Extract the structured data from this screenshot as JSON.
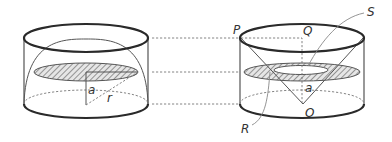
{
  "figure": {
    "colors": {
      "line": "#2a2a2a",
      "dash": "#777777",
      "hatch": "#666666",
      "background": "#ffffff"
    },
    "left_solid": {
      "name": "hemisphere-in-cylinder",
      "labels": {
        "height": "a",
        "radius": "r"
      }
    },
    "right_solid": {
      "name": "cylinder-minus-cone",
      "labels": {
        "P": "P",
        "Q": "Q",
        "S": "S",
        "R": "R",
        "O": "O",
        "height": "a"
      }
    },
    "guide_lines": {
      "levels_y": [
        38,
        72,
        104
      ]
    }
  }
}
